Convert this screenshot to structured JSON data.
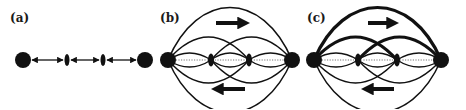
{
  "figure": {
    "panels": [
      {
        "id": "a",
        "label": "(a)",
        "label_pos": [
          10,
          22
        ],
        "type": "chain",
        "nodes": [
          {
            "kind": "terminal",
            "x": 23,
            "y": 60,
            "r": 8
          },
          {
            "kind": "scatterer",
            "x": 67,
            "y": 60,
            "rx": 2.5,
            "ry": 6
          },
          {
            "kind": "scatterer",
            "x": 103,
            "y": 60,
            "rx": 2.5,
            "ry": 6
          },
          {
            "kind": "terminal",
            "x": 145,
            "y": 60,
            "r": 8
          }
        ],
        "links": "bidirectional-arrows"
      },
      {
        "id": "b",
        "label": "(b)",
        "label_pos": [
          160,
          22
        ],
        "type": "lens-network",
        "left": {
          "x": 168,
          "y": 60,
          "r": 8
        },
        "right": {
          "x": 292,
          "y": 60,
          "r": 8
        },
        "scatterers": [
          {
            "x": 211,
            "y": 60
          },
          {
            "x": 249,
            "y": 60
          }
        ],
        "arrow_right": {
          "x1": 216,
          "x2": 245,
          "y": 23
        },
        "arrow_left": {
          "x1": 245,
          "x2": 216,
          "y": 89
        },
        "thick_upper": false
      },
      {
        "id": "c",
        "label": "(c)",
        "label_pos": [
          307,
          22
        ],
        "type": "lens-network",
        "left": {
          "x": 314,
          "y": 60,
          "r": 8
        },
        "right": {
          "x": 441,
          "y": 60,
          "r": 8
        },
        "scatterers": [
          {
            "x": 358,
            "y": 60
          },
          {
            "x": 397,
            "y": 60
          }
        ],
        "arrow_right": {
          "x1": 368,
          "x2": 394,
          "y": 23
        },
        "arrow_left": {
          "x1": 394,
          "x2": 366,
          "y": 89
        },
        "thick_upper": true
      }
    ],
    "colors": {
      "ink": "#111111",
      "dotted": "#777777",
      "background": "#ffffff"
    }
  }
}
